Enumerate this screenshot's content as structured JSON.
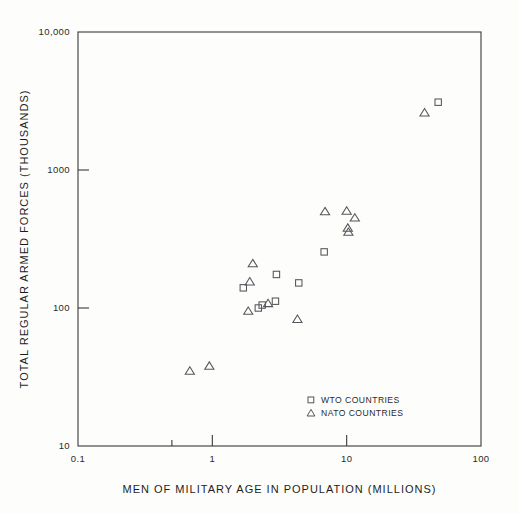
{
  "chart_data": {
    "type": "scatter",
    "title": "",
    "xlabel": "MEN OF MILITARY AGE IN POPULATION (MILLIONS)",
    "ylabel": "TOTAL REGULAR ARMED FORCES (THOUSANDS)",
    "xscale": "log",
    "yscale": "log",
    "xlim": [
      0.1,
      100
    ],
    "ylim": [
      10,
      10000
    ],
    "xticks": [
      0.1,
      1,
      10,
      100
    ],
    "xticklabels": [
      "0.1",
      "1",
      "10",
      "100"
    ],
    "yticks": [
      10,
      100,
      1000,
      10000
    ],
    "yticklabels": [
      "10",
      "100",
      "1000",
      "10,000"
    ],
    "grid": false,
    "legend_position": "lower right",
    "series": [
      {
        "name": "WTO COUNTRIES",
        "marker": "square",
        "points": [
          {
            "x": 1.7,
            "y": 140
          },
          {
            "x": 2.2,
            "y": 100
          },
          {
            "x": 2.35,
            "y": 105
          },
          {
            "x": 2.95,
            "y": 112
          },
          {
            "x": 3.0,
            "y": 175
          },
          {
            "x": 4.4,
            "y": 152
          },
          {
            "x": 6.8,
            "y": 255
          },
          {
            "x": 48,
            "y": 3100
          }
        ]
      },
      {
        "name": "NATO COUNTRIES",
        "marker": "triangle",
        "points": [
          {
            "x": 0.68,
            "y": 35
          },
          {
            "x": 0.95,
            "y": 38
          },
          {
            "x": 1.85,
            "y": 95
          },
          {
            "x": 1.9,
            "y": 155
          },
          {
            "x": 2.0,
            "y": 210
          },
          {
            "x": 2.6,
            "y": 108
          },
          {
            "x": 4.3,
            "y": 83
          },
          {
            "x": 6.9,
            "y": 500
          },
          {
            "x": 10.0,
            "y": 505
          },
          {
            "x": 10.2,
            "y": 380
          },
          {
            "x": 10.3,
            "y": 355
          },
          {
            "x": 11.5,
            "y": 450
          },
          {
            "x": 38,
            "y": 2600
          }
        ]
      }
    ],
    "legend_entries": [
      {
        "marker": "square",
        "label": "WTO COUNTRIES"
      },
      {
        "marker": "triangle",
        "label": "NATO COUNTRIES"
      }
    ]
  }
}
